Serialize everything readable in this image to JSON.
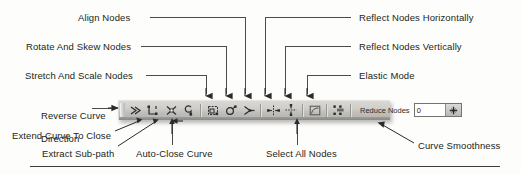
{
  "figure": {
    "line_color": "#4b4b4b",
    "text_color": "#231f20",
    "toolbar_face": "#cfcecb"
  },
  "callouts": {
    "align_nodes": "Align Nodes",
    "rotate_and_skew_nodes": "Rotate And Skew Nodes",
    "stretch_and_scale_nodes": "Stretch And Scale Nodes",
    "reverse_curve_direction_line1": "Reverse Curve",
    "reverse_curve_direction_line2": "Direction",
    "extend_curve_to_close": "Extend Curve To Close",
    "extract_sub_path": "Extract Sub-path",
    "auto_close_curve": "Auto-Close Curve",
    "reflect_nodes_horizontally": "Reflect Nodes Horizontally",
    "reflect_nodes_vertically": "Reflect Nodes Vertically",
    "elastic_mode": "Elastic Mode",
    "select_all_nodes": "Select All Nodes",
    "curve_smoothness": "Curve Smoothness"
  },
  "toolbar": {
    "buttons": [
      {
        "name": "reverse-curve-direction",
        "icon": "reverse-curve-direction-icon"
      },
      {
        "name": "extend-curve-to-close",
        "icon": "extend-curve-to-close-icon"
      },
      {
        "name": "extract-sub-path",
        "icon": "extract-sub-path-icon"
      },
      {
        "name": "auto-close-curve",
        "icon": "auto-close-curve-icon"
      },
      {
        "name": "stretch-and-scale-nodes",
        "icon": "stretch-and-scale-nodes-icon"
      },
      {
        "name": "rotate-and-skew-nodes",
        "icon": "rotate-and-skew-nodes-icon"
      },
      {
        "name": "align-nodes",
        "icon": "align-nodes-icon"
      },
      {
        "name": "reflect-nodes-horizontally",
        "icon": "reflect-nodes-horizontally-icon"
      },
      {
        "name": "reflect-nodes-vertically",
        "icon": "reflect-nodes-vertically-icon"
      },
      {
        "name": "elastic-mode",
        "icon": "elastic-mode-icon"
      },
      {
        "name": "select-all-nodes",
        "icon": "select-all-nodes-icon"
      }
    ],
    "reduce_nodes_label": "Reduce Nodes",
    "reduce_nodes_value": "0",
    "reduce_nodes_placeholder": "0",
    "spinner_icon": "curve-smoothness-spinner-icon"
  }
}
